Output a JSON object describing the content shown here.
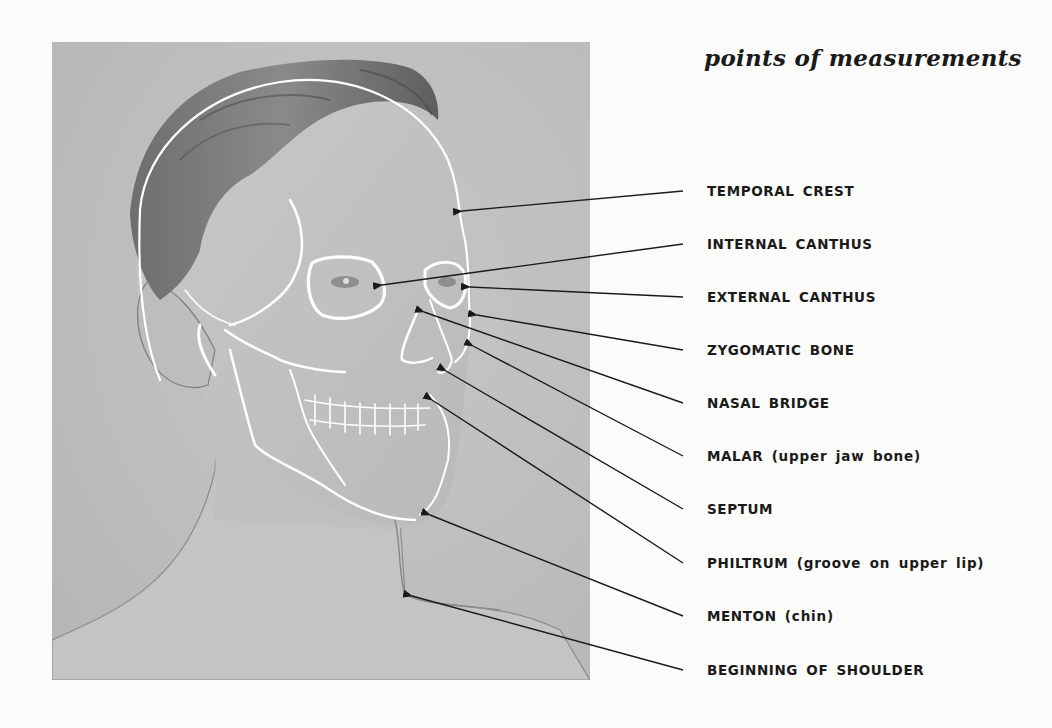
{
  "figure": {
    "title": "points of measurements",
    "colors": {
      "background": "#fbfbf9",
      "photo": "#bfbfbd",
      "skull_outline": "#ffffff",
      "arrow": "#1a1a1a",
      "text": "#1a1a1a"
    },
    "labels": [
      {
        "main": "TEMPORAL CREST",
        "note": "",
        "y": 183,
        "tip": [
          455,
          212
        ]
      },
      {
        "main": "INTERNAL CANTHUS",
        "note": "",
        "y": 236,
        "tip": [
          374,
          286
        ]
      },
      {
        "main": "EXTERNAL CANTHUS",
        "note": "",
        "y": 289,
        "tip": [
          462,
          287
        ]
      },
      {
        "main": "ZYGOMATIC BONE",
        "note": "",
        "y": 342,
        "tip": [
          470,
          312
        ]
      },
      {
        "main": "NASAL BRIDGE",
        "note": "",
        "y": 395,
        "tip": [
          417,
          309
        ]
      },
      {
        "main": "MALAR",
        "note": "(upper jaw bone)",
        "y": 448,
        "tip": [
          466,
          342
        ]
      },
      {
        "main": "SEPTUM",
        "note": "",
        "y": 501,
        "tip": [
          440,
          366
        ]
      },
      {
        "main": "PHILTRUM",
        "note": "(groove on upper lip)",
        "y": 555,
        "tip": [
          426,
          395
        ]
      },
      {
        "main": "MENTON",
        "note": "(chin)",
        "y": 608,
        "tip": [
          422,
          512
        ]
      },
      {
        "main": "BEGINNING OF SHOULDER",
        "note": "",
        "y": 662,
        "tip": [
          404,
          593
        ]
      }
    ]
  }
}
